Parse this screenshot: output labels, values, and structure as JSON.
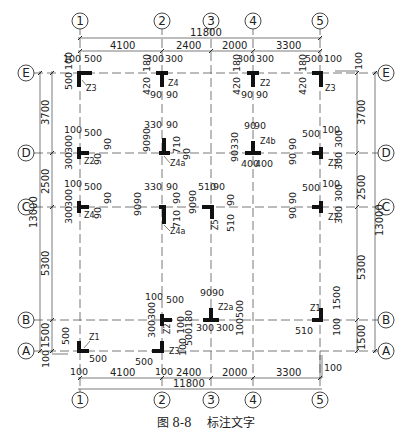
{
  "figure": {
    "caption_number": "图 8-8",
    "caption_title": "标注文字"
  },
  "axes": {
    "vertical": [
      {
        "label": "1",
        "x": 80
      },
      {
        "label": "2",
        "x": 162
      },
      {
        "label": "3",
        "x": 211
      },
      {
        "label": "4",
        "x": 253
      },
      {
        "label": "5",
        "x": 320
      }
    ],
    "horizontal": [
      {
        "label": "E",
        "y": 73
      },
      {
        "label": "D",
        "y": 153
      },
      {
        "label": "C",
        "y": 207
      },
      {
        "label": "B",
        "y": 320
      },
      {
        "label": "A",
        "y": 351
      }
    ]
  },
  "dimensions": {
    "top_total": "11800",
    "top_spans": [
      "4100",
      "2400",
      "2000",
      "3300"
    ],
    "bottom_total": "11800",
    "bottom_spans": [
      "4100",
      "2400",
      "2000",
      "3300"
    ],
    "left_total": "13000",
    "left_spans": [
      "3700",
      "2500",
      "5300",
      "1500"
    ],
    "right_total": "13000",
    "right_spans": [
      "3700",
      "2500",
      "5300",
      "1500"
    ],
    "right_offset_top": "100",
    "left_offset_bottom": "100",
    "bottom_offset_1": "100",
    "bottom_offset_2": "100",
    "bottom_offset_5": "100"
  },
  "columns": [
    {
      "id": "E1",
      "label": "Z3",
      "dims": [
        "100",
        "500",
        "100",
        "500"
      ]
    },
    {
      "id": "E2",
      "label": "Z4",
      "dims": [
        "300",
        "300",
        "180",
        "420",
        "90",
        "90"
      ]
    },
    {
      "id": "E4",
      "label": "Z2",
      "dims": [
        "300",
        "300",
        "180",
        "420",
        "90",
        "90"
      ]
    },
    {
      "id": "E5",
      "label": "Z3",
      "dims": [
        "500",
        "100",
        "180",
        "420"
      ]
    },
    {
      "id": "D1",
      "label": "Z2",
      "dims": [
        "100",
        "500",
        "300",
        "300",
        "90",
        "90"
      ]
    },
    {
      "id": "D2",
      "label": "Z4a",
      "dims": [
        "330",
        "90",
        "90",
        "90",
        "710",
        "90"
      ]
    },
    {
      "id": "D4",
      "label": "Z4b",
      "dims": [
        "90",
        "90",
        "90",
        "330",
        "400",
        "400"
      ]
    },
    {
      "id": "D5",
      "label": "Z2",
      "dims": [
        "500",
        "100",
        "90",
        "90",
        "300",
        "300"
      ]
    },
    {
      "id": "C1",
      "label": "Z4",
      "dims": [
        "100",
        "500",
        "300",
        "300",
        "90",
        "90"
      ]
    },
    {
      "id": "C2",
      "label": "Z4a",
      "dims": [
        "330",
        "90",
        "90",
        "90",
        "710",
        "90"
      ]
    },
    {
      "id": "C3",
      "label": "Z5",
      "dims": [
        "510",
        "90",
        "90",
        "90",
        "90",
        "510"
      ]
    },
    {
      "id": "C5",
      "label": "Z2",
      "dims": [
        "500",
        "100",
        "90",
        "90",
        "300",
        "300"
      ]
    },
    {
      "id": "B2",
      "label": "Z2",
      "dims": [
        "100",
        "500",
        "300",
        "300",
        "180",
        "100"
      ]
    },
    {
      "id": "B3",
      "label": "Z2a",
      "dims": [
        "90",
        "90",
        "500",
        "100",
        "300",
        "300"
      ]
    },
    {
      "id": "B5",
      "label": "Z1",
      "dims": [
        "1500",
        "100",
        "510"
      ]
    },
    {
      "id": "A1",
      "label": "Z1",
      "dims": [
        "500",
        "500",
        "100"
      ]
    },
    {
      "id": "A2",
      "label": "Z3",
      "dims": [
        "500",
        "100",
        "500",
        "100"
      ]
    }
  ]
}
